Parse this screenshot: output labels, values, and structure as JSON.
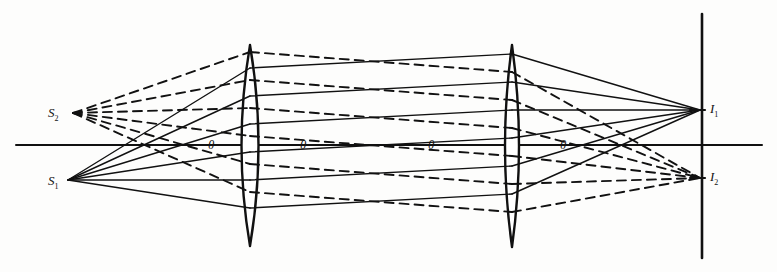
{
  "figure": {
    "kind": "optical-ray-diagram",
    "title": "",
    "ink_color": "#111111",
    "paper_color": "#fdfdfc"
  },
  "labels": {
    "source_upper": {
      "text": "S",
      "sub": "2",
      "x": 48,
      "y": 106
    },
    "source_lower": {
      "text": "S",
      "sub": "1",
      "x": 48,
      "y": 174
    },
    "image_upper": {
      "text": "I",
      "sub": "1",
      "x": 710,
      "y": 102
    },
    "image_lower": {
      "text": "I",
      "sub": "2",
      "x": 710,
      "y": 170
    }
  },
  "angles": [
    {
      "text": "θ",
      "x": 208,
      "y": 138
    },
    {
      "text": "θ",
      "x": 300,
      "y": 138
    },
    {
      "text": "θ",
      "x": 428,
      "y": 138
    },
    {
      "text": "θ",
      "x": 560,
      "y": 138
    }
  ],
  "geometry": {
    "axis": {
      "y": 145,
      "x_start": 16,
      "x_end": 762
    },
    "lens1": {
      "x": 250,
      "top": 45,
      "bottom": 246,
      "half_width": 17
    },
    "lens2": {
      "x": 512,
      "top": 45,
      "bottom": 247,
      "half_width": 14
    },
    "image_plane": {
      "x": 702,
      "top": 14,
      "bottom": 258
    },
    "source1": {
      "x": 68,
      "y": 180
    },
    "source2": {
      "x": 73,
      "y": 113
    },
    "image1": {
      "x": 700,
      "y": 110
    },
    "image2": {
      "x": 700,
      "y": 178
    },
    "ray_heights_lens1": [
      68,
      96,
      124,
      152,
      180,
      208
    ],
    "ray_heights_lens2": [
      62,
      90,
      118,
      146,
      174,
      202
    ]
  },
  "ray_bundles": {
    "solid": {
      "style": "solid",
      "from": "S1",
      "to": "I1"
    },
    "dashed": {
      "style": "dashed",
      "from": "S2",
      "to": "I2"
    }
  }
}
